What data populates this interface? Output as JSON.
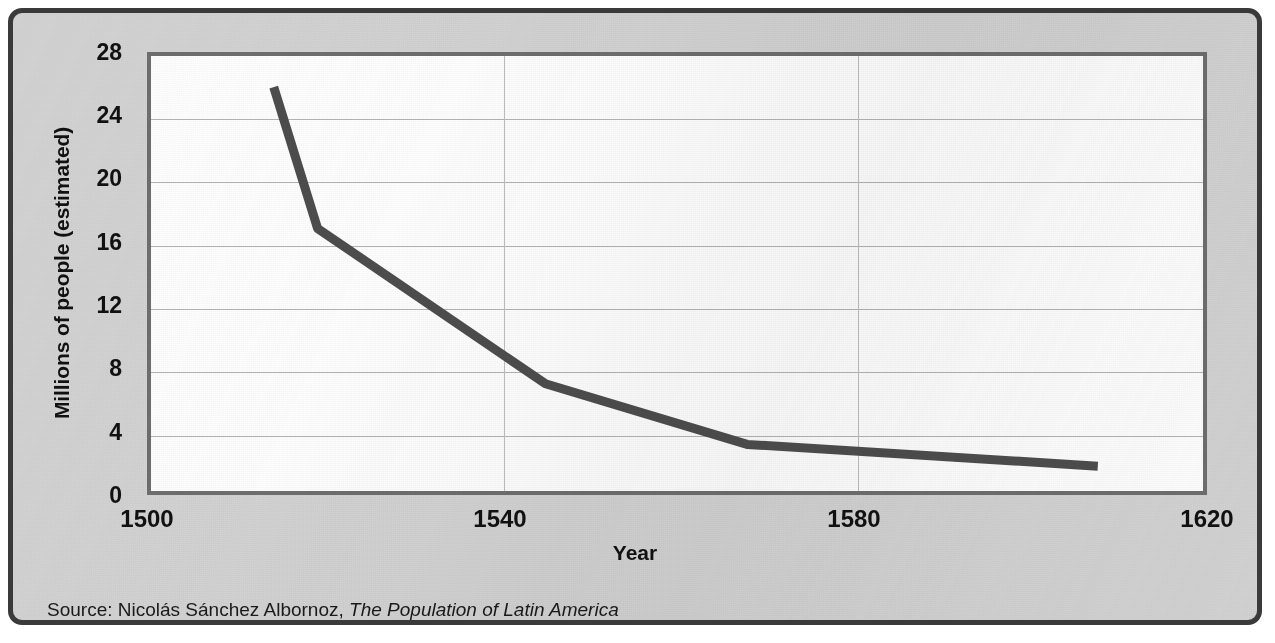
{
  "figure": {
    "frame_color": "#3a3a3a",
    "card_background": "#d2d2d2",
    "plot_background": "#fdfdfd",
    "plot_border_color": "#6e6e6e",
    "gridline_color": "#b4b4b4",
    "series_color": "#4d4d4d"
  },
  "axes": {
    "y_title": "Millions of people (estimated)",
    "x_title": "Year",
    "y_ticks": [
      "28",
      "24",
      "20",
      "16",
      "12",
      "8",
      "4",
      "0"
    ],
    "x_ticks": [
      "1500",
      "1540",
      "1580",
      "1620"
    ]
  },
  "source": {
    "prefix": "Source: Nicolás Sánchez Albornoz, ",
    "work_title": "The Population of Latin America"
  },
  "chart_data": {
    "type": "line",
    "title": "",
    "subtitle": "",
    "xlabel": "Year",
    "ylabel": "Millions of people (estimated)",
    "xlim": [
      1500,
      1620
    ],
    "ylim": [
      0,
      28
    ],
    "xticks": [
      1500,
      1540,
      1580,
      1620
    ],
    "yticks": [
      0,
      4,
      8,
      12,
      16,
      20,
      24,
      28
    ],
    "grid": true,
    "grid_axes": "both",
    "legend": false,
    "annotations": [],
    "series": [
      {
        "name": "Estimated population of Latin America",
        "color": "#4d4d4d",
        "x": [
          1514,
          1519,
          1545,
          1568,
          1608
        ],
        "values": [
          26.0,
          16.9,
          6.9,
          3.0,
          1.6
        ]
      }
    ]
  }
}
